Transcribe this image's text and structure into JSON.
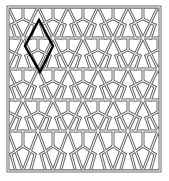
{
  "figure": {
    "width": 169,
    "height": 181,
    "background": "#ffffff",
    "line_color": "#6b6b6b",
    "fill_color": "#ffffff",
    "highlight_color": "#000000"
  },
  "frame": {
    "x": 8,
    "y": 7,
    "w": 152,
    "h": 164
  },
  "lattice": {
    "type": "islamic-geometric-double-line",
    "band_rows_y": [
      7,
      38,
      69,
      100,
      131,
      171
    ],
    "row_height": 31,
    "cell_width": 30,
    "column_origin_x": 8
  },
  "highlight": {
    "shape": "rhombus",
    "label": "unit cell",
    "points": [
      [
        39,
        20
      ],
      [
        53,
        46
      ],
      [
        40,
        72
      ],
      [
        25,
        46
      ]
    ],
    "stroke_width": 2.4
  }
}
